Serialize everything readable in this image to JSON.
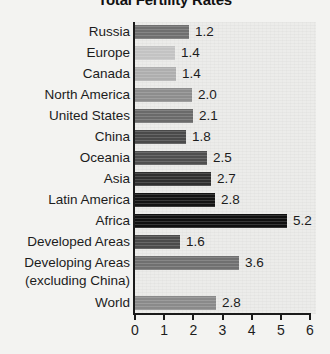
{
  "chart_data": {
    "type": "bar",
    "orientation": "horizontal",
    "title": "Total Fertility Rates",
    "xlabel": "",
    "ylabel": "",
    "xlim": [
      0,
      6
    ],
    "xticks": [
      0,
      1,
      2,
      3,
      4,
      5,
      6
    ],
    "grid": false,
    "legend": null,
    "categories": [
      "Russia",
      "Europe",
      "Canada",
      "North America",
      "United States",
      "China",
      "Oceania",
      "Asia",
      "Latin America",
      "Africa",
      "Developed Areas",
      "Developing Areas",
      "World"
    ],
    "values": [
      1.2,
      1.4,
      1.4,
      2.0,
      2.1,
      1.8,
      2.5,
      2.7,
      2.8,
      5.2,
      1.6,
      3.6,
      2.8
    ],
    "value_labels": [
      "1.2",
      "1.4",
      "1.4",
      "2.0",
      "2.1",
      "1.8",
      "2.5",
      "2.7",
      "2.8",
      "5.2",
      "1.6",
      "3.6",
      "2.8"
    ],
    "bar_colors": [
      "#6f6f6f",
      "#c3c3c3",
      "#aeaeae",
      "#8d8d8d",
      "#6a6a6a",
      "#4a4a4a",
      "#4f4f4f",
      "#2f2f2f",
      "#141414",
      "#101010",
      "#4b4b4b",
      "#707070",
      "#8a8a8a"
    ],
    "bar_pixel_ends": [
      189,
      175,
      176,
      192,
      193,
      186,
      207,
      211,
      215,
      287,
      180,
      239,
      216
    ],
    "wrapped_label_continuation": "(excluding China)",
    "wrapped_label_after_index": 11
  },
  "ticklabels": [
    "0",
    "1",
    "2",
    "3",
    "4",
    "5",
    "6"
  ]
}
